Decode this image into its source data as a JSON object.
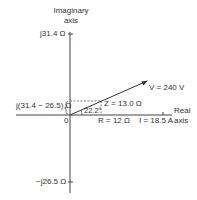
{
  "diagram": {
    "type": "impedance phasor diagram",
    "axes": {
      "imaginary_label_line1": "Imaginary",
      "imaginary_label_line2": "axis",
      "real_label_line1": "Real",
      "real_label_line2": "axis",
      "origin_label": "0"
    },
    "ticks": {
      "top": "j31.4 Ω",
      "bottom": "−j26.5 Ω",
      "net_reactance": "j(31.4 − 26.5) Ω"
    },
    "phasors": {
      "voltage": "V = 240 V",
      "impedance": "Z = 13.0 Ω",
      "resistance": "R = 12 Ω",
      "current": "I = 18.5 A"
    },
    "angle": "22.2°",
    "colors": {
      "line": "#333333",
      "dashed": "#555555",
      "text": "#333333"
    }
  }
}
